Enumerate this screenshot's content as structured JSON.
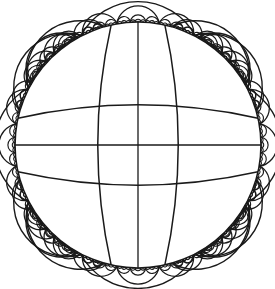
{
  "diagram": {
    "type": "hyperbolic-tiling",
    "model": "Poincare disk",
    "central_geodesics": 4,
    "diameters": 2,
    "colors": {
      "line": "#1a1a1a",
      "background": "#ffffff"
    }
  }
}
